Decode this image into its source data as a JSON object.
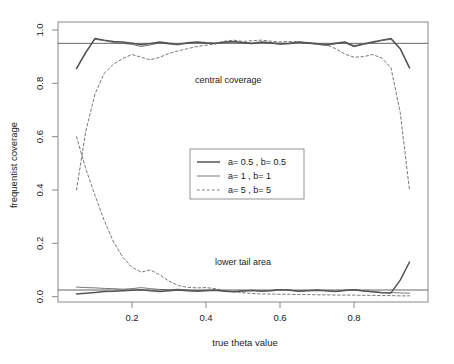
{
  "chart_data": {
    "type": "line",
    "title": "",
    "xlabel": "true theta value",
    "ylabel": "frequentist coverage",
    "xlim": [
      0.0,
      1.0
    ],
    "ylim": [
      -0.02,
      1.03
    ],
    "xticks": [
      "0.2",
      "0.4",
      "0.6",
      "0.8"
    ],
    "xtick_values": [
      0.2,
      0.4,
      0.6,
      0.8
    ],
    "yticks": [
      "0.0",
      "0.2",
      "0.4",
      "0.6",
      "0.8",
      "1.0"
    ],
    "ytick_values": [
      0.0,
      0.2,
      0.4,
      0.6,
      0.8,
      1.0
    ],
    "grid": false,
    "box": true,
    "legend_position": "center",
    "annotations": [
      {
        "text": "central coverage",
        "x": 0.46,
        "y": 0.8
      },
      {
        "text": "lower tail area",
        "x": 0.5,
        "y": 0.12
      }
    ],
    "reference_lines": [
      {
        "y": 0.95,
        "style": "solid"
      },
      {
        "y": 0.025,
        "style": "solid"
      }
    ],
    "x": [
      0.05,
      0.075,
      0.1,
      0.125,
      0.15,
      0.175,
      0.2,
      0.225,
      0.25,
      0.275,
      0.3,
      0.325,
      0.35,
      0.375,
      0.4,
      0.425,
      0.45,
      0.475,
      0.5,
      0.525,
      0.55,
      0.575,
      0.6,
      0.625,
      0.65,
      0.675,
      0.7,
      0.725,
      0.75,
      0.775,
      0.8,
      0.825,
      0.85,
      0.875,
      0.9,
      0.925,
      0.95
    ],
    "series": [
      {
        "name": "a= 0.5 , b= 0.5 central coverage",
        "group": "central coverage",
        "style": "solid",
        "width": "thick",
        "values": [
          0.855,
          0.915,
          0.968,
          0.962,
          0.957,
          0.955,
          0.95,
          0.945,
          0.949,
          0.955,
          0.95,
          0.947,
          0.952,
          0.955,
          0.952,
          0.95,
          0.955,
          0.957,
          0.953,
          0.95,
          0.955,
          0.952,
          0.948,
          0.95,
          0.955,
          0.952,
          0.948,
          0.945,
          0.95,
          0.955,
          0.94,
          0.948,
          0.955,
          0.962,
          0.968,
          0.93,
          0.858
        ]
      },
      {
        "name": "a= 1 , b= 1 central coverage",
        "group": "central coverage",
        "style": "solid",
        "width": "thin",
        "values": [
          0.857,
          0.918,
          0.965,
          0.96,
          0.953,
          0.95,
          0.946,
          0.938,
          0.944,
          0.952,
          0.947,
          0.944,
          0.95,
          0.953,
          0.95,
          0.948,
          0.953,
          0.955,
          0.951,
          0.948,
          0.953,
          0.95,
          0.946,
          0.948,
          0.953,
          0.95,
          0.946,
          0.942,
          0.948,
          0.952,
          0.937,
          0.945,
          0.952,
          0.96,
          0.965,
          0.928,
          0.86
        ]
      },
      {
        "name": "a= 5 , b= 5 central coverage",
        "group": "central coverage",
        "style": "dashed",
        "width": "thin",
        "values": [
          0.4,
          0.62,
          0.76,
          0.838,
          0.872,
          0.893,
          0.908,
          0.898,
          0.888,
          0.898,
          0.912,
          0.922,
          0.93,
          0.938,
          0.943,
          0.948,
          0.958,
          0.962,
          0.957,
          0.96,
          0.962,
          0.958,
          0.955,
          0.957,
          0.955,
          0.952,
          0.95,
          0.945,
          0.93,
          0.91,
          0.898,
          0.9,
          0.908,
          0.895,
          0.858,
          0.69,
          0.4
        ]
      },
      {
        "name": "a= 0.5 , b= 0.5 lower tail area",
        "group": "lower tail area",
        "style": "solid",
        "width": "thick",
        "values": [
          0.01,
          0.013,
          0.016,
          0.019,
          0.02,
          0.022,
          0.024,
          0.026,
          0.022,
          0.019,
          0.022,
          0.025,
          0.022,
          0.02,
          0.022,
          0.024,
          0.02,
          0.018,
          0.021,
          0.023,
          0.02,
          0.022,
          0.026,
          0.024,
          0.02,
          0.022,
          0.024,
          0.022,
          0.019,
          0.023,
          0.026,
          0.021,
          0.018,
          0.015,
          0.014,
          0.062,
          0.13
        ]
      },
      {
        "name": "a= 1 , b= 1 lower tail area",
        "group": "lower tail area",
        "style": "solid",
        "width": "thin",
        "values": [
          0.036,
          0.034,
          0.033,
          0.031,
          0.03,
          0.028,
          0.03,
          0.034,
          0.03,
          0.027,
          0.026,
          0.028,
          0.025,
          0.023,
          0.024,
          0.025,
          0.022,
          0.02,
          0.022,
          0.024,
          0.021,
          0.023,
          0.027,
          0.025,
          0.021,
          0.023,
          0.025,
          0.022,
          0.02,
          0.024,
          0.027,
          0.022,
          0.019,
          0.016,
          0.015,
          0.014,
          0.013
        ]
      },
      {
        "name": "a= 5 , b= 5 lower tail area",
        "group": "lower tail area",
        "style": "dashed",
        "width": "thin",
        "values": [
          0.6,
          0.48,
          0.38,
          0.285,
          0.205,
          0.148,
          0.11,
          0.092,
          0.1,
          0.082,
          0.058,
          0.042,
          0.035,
          0.033,
          0.034,
          0.03,
          0.022,
          0.018,
          0.015,
          0.012,
          0.01,
          0.01,
          0.009,
          0.009,
          0.008,
          0.008,
          0.007,
          0.007,
          0.006,
          0.006,
          0.006,
          0.005,
          0.005,
          0.004,
          0.004,
          0.003,
          0.003
        ]
      }
    ],
    "legend": [
      {
        "label": "a= 0.5 , b= 0.5",
        "style": "solid",
        "width": "thick"
      },
      {
        "label": "a= 1 , b= 1",
        "style": "solid",
        "width": "thin"
      },
      {
        "label": "a= 5 , b= 5",
        "style": "dashed",
        "width": "thin"
      }
    ]
  },
  "colors": {
    "line": "#555555",
    "box": "#888888",
    "text": "#1a1a1a",
    "background": "#ffffff"
  }
}
